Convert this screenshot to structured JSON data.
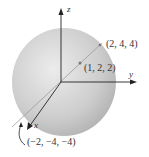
{
  "diagram": {
    "axes": {
      "x": "x",
      "y": "y",
      "z": "z"
    },
    "points": [
      {
        "label": "(2, 4, 4)"
      },
      {
        "label": "(1, 2, 2)"
      },
      {
        "label": "(−2, −4, −4)"
      }
    ],
    "colors": {
      "sphere": "#cfcfcf",
      "axis": "#222222",
      "diameter": "#9a9a9a"
    }
  }
}
